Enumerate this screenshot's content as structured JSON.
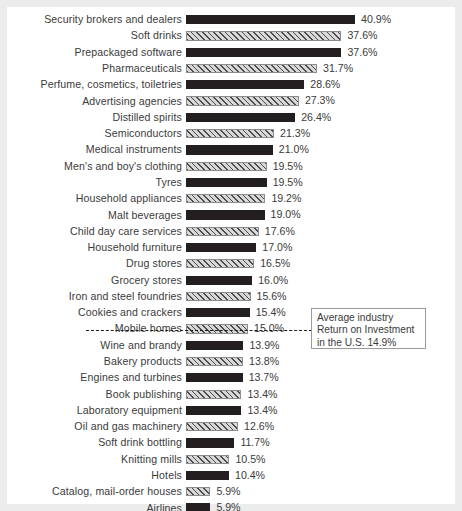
{
  "chart_data": {
    "type": "bar",
    "title": "",
    "subtitle": "",
    "xlabel": "",
    "ylabel": "",
    "orientation": "horizontal",
    "xlim": [
      0,
      40.9
    ],
    "grid": false,
    "legend_position": "none",
    "value_suffix": "%",
    "categories": [
      "Security brokers and dealers",
      "Soft drinks",
      "Prepackaged software",
      "Pharmaceuticals",
      "Perfume, cosmetics, toiletries",
      "Advertising agencies",
      "Distilled spirits",
      "Semiconductors",
      "Medical instruments",
      "Men's and boy's clothing",
      "Tyres",
      "Household appliances",
      "Malt beverages",
      "Child day care services",
      "Household furniture",
      "Drug stores",
      "Grocery stores",
      "Iron and steel foundries",
      "Cookies and crackers",
      "Mobile homes",
      "Wine and brandy",
      "Bakery products",
      "Engines and turbines",
      "Book publishing",
      "Laboratory equipment",
      "Oil and gas machinery",
      "Soft drink bottling",
      "Knitting mills",
      "Hotels",
      "Catalog, mail-order houses",
      "Airlines"
    ],
    "values": [
      40.9,
      37.6,
      37.6,
      31.7,
      28.6,
      27.3,
      26.4,
      21.3,
      21.0,
      19.5,
      19.5,
      19.2,
      19.0,
      17.6,
      17.0,
      16.5,
      16.0,
      15.6,
      15.4,
      15.0,
      13.9,
      13.8,
      13.7,
      13.4,
      13.4,
      12.6,
      11.7,
      10.5,
      10.4,
      5.9,
      5.9
    ],
    "value_labels": [
      "40.9%",
      "37.6%",
      "37.6%",
      "31.7%",
      "28.6%",
      "27.3%",
      "26.4%",
      "21.3%",
      "21.0%",
      "19.5%",
      "19.5%",
      "19.2%",
      "19.0%",
      "17.6%",
      "17.0%",
      "16.5%",
      "16.0%",
      "15.6%",
      "15.4%",
      "15.0%",
      "13.9%",
      "13.8%",
      "13.7%",
      "13.4%",
      "13.4%",
      "12.6%",
      "11.7%",
      "10.5%",
      "10.4%",
      "5.9%",
      "5.9%"
    ],
    "bar_styles": [
      "solid",
      "hatched",
      "solid",
      "hatched",
      "solid",
      "hatched",
      "solid",
      "hatched",
      "solid",
      "hatched",
      "solid",
      "hatched",
      "solid",
      "hatched",
      "solid",
      "hatched",
      "solid",
      "hatched",
      "solid",
      "hatched",
      "solid",
      "hatched",
      "solid",
      "hatched",
      "solid",
      "hatched",
      "solid",
      "hatched",
      "solid",
      "hatched",
      "solid"
    ],
    "colors": {
      "bar_solid": "#231f20",
      "bar_hatch_fill": "#d2d2d2",
      "bar_hatch_line": "#4a4a4a",
      "text": "#3b3b3b",
      "average_line": "#1c1c1c",
      "callout_border": "#9a9a9a",
      "background": "#ffffff",
      "frame": "#ececec"
    },
    "annotations": [
      {
        "name": "average-industry-roi",
        "value": 14.9,
        "value_label": "14.9%",
        "line_style": "dashed",
        "lines": [
          "Average industry",
          "Return on Investment",
          "in the U.S. 14.9%"
        ]
      }
    ]
  }
}
